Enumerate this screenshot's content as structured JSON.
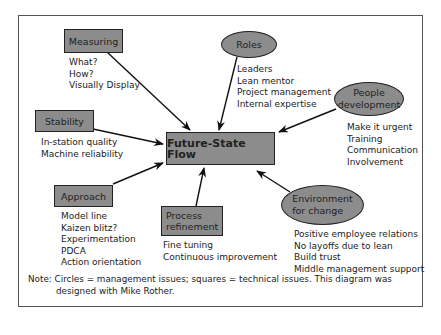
{
  "diagram": {
    "center": {
      "label": "Future-State Flow",
      "shape": "square"
    },
    "nodes": [
      {
        "id": "measuring",
        "label": "Measuring",
        "shape": "square",
        "items": [
          "What?",
          "How?",
          "Visually Display"
        ]
      },
      {
        "id": "roles",
        "label": "Roles",
        "shape": "circle",
        "items": [
          "Leaders",
          "Lean mentor",
          "Project management",
          "Internal expertise"
        ]
      },
      {
        "id": "stability",
        "label": "Stability",
        "shape": "square",
        "items": [
          "In-station quality",
          "Machine reliability"
        ]
      },
      {
        "id": "people-development",
        "label_line1": "People",
        "label_line2": "development",
        "shape": "circle",
        "items": [
          "Make it urgent",
          "Training",
          "Communication",
          "Involvement"
        ]
      },
      {
        "id": "approach",
        "label": "Approach",
        "shape": "square",
        "items": [
          "Model line",
          "Kaizen blitz?",
          "Experimentation",
          "PDCA",
          "Action orientation"
        ]
      },
      {
        "id": "process-refinement",
        "label_line1": "Process",
        "label_line2": "refinement",
        "shape": "square",
        "items": [
          "Fine tuning",
          "Continuous improvement"
        ]
      },
      {
        "id": "environment-for-change",
        "label_line1": "Environment",
        "label_line2": "for change",
        "shape": "circle",
        "items": [
          "Positive employee relations",
          "No layoffs due to lean",
          "Build trust",
          "Middle management support"
        ]
      }
    ],
    "note": {
      "line1": "Note: Circles = management issues; squares = technical issues. This diagram was",
      "line2": "designed with Mike Rother."
    },
    "colors": {
      "node_fill": "#8c8c8c",
      "border": "#222222",
      "background": "#ffffff"
    }
  }
}
